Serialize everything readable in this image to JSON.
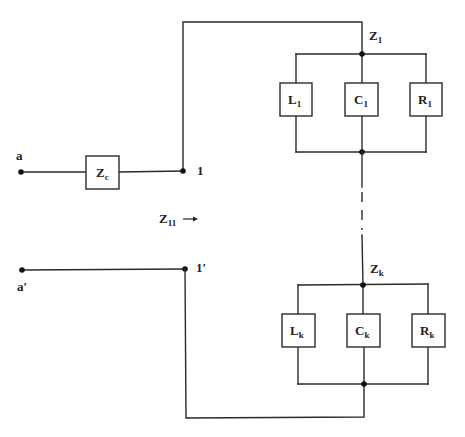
{
  "terminals": {
    "a": {
      "label": "a",
      "sub": ""
    },
    "a_prime": {
      "label": "a′",
      "sub": ""
    },
    "n1": {
      "label": "1",
      "sub": ""
    },
    "n1_prime": {
      "label": "1′",
      "sub": ""
    }
  },
  "impedances": {
    "zc": {
      "label": "Z",
      "sub": "c"
    },
    "z1": {
      "label": "Z",
      "sub": "1"
    },
    "zk": {
      "label": "Z",
      "sub": "k"
    },
    "z11": {
      "label": "Z",
      "sub": "11",
      "arrow": "right-arrow"
    }
  },
  "branches": {
    "branch1": {
      "components": [
        {
          "label": "L",
          "sub": "1",
          "type": "inductor"
        },
        {
          "label": "C",
          "sub": "1",
          "type": "capacitor"
        },
        {
          "label": "R",
          "sub": "1",
          "type": "resistor"
        }
      ]
    },
    "branchk": {
      "components": [
        {
          "label": "L",
          "sub": "k",
          "type": "inductor"
        },
        {
          "label": "C",
          "sub": "k",
          "type": "capacitor"
        },
        {
          "label": "R",
          "sub": "k",
          "type": "resistor"
        }
      ]
    }
  },
  "colors": {
    "wire": "#2b2b2b",
    "node": "#111111",
    "text": "#222222",
    "background": "#ffffff"
  }
}
